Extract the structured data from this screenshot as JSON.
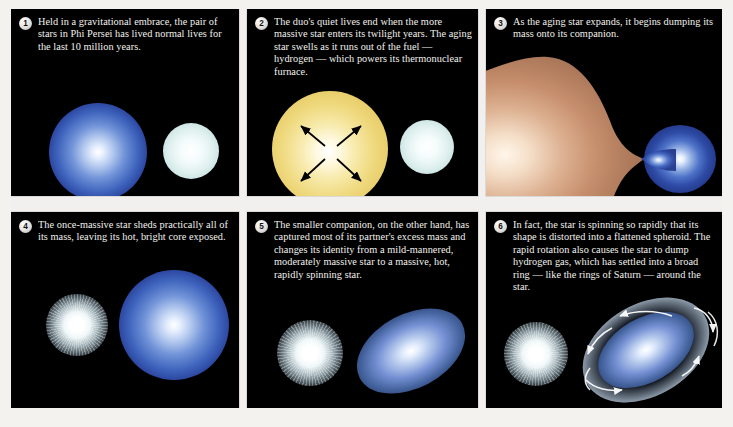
{
  "figure": {
    "background_color": "#f2f0ee",
    "panel_background": "#000000",
    "text_color": "#f3f2ee"
  },
  "panels": [
    {
      "number": "1",
      "caption": "Held in a gravitational embrace, the pair of stars in Phi Persei has lived normal lives for the last 10 million years.",
      "objects": [
        {
          "name": "massive-blue-star",
          "color": "#3f64bd"
        },
        {
          "name": "companion-white-star",
          "color": "#dff0ef"
        }
      ]
    },
    {
      "number": "2",
      "caption": "The duo's quiet lives end when the more massive star enters its twilight years. The aging star swells as it runs out of the fuel — hydrogen — which powers its thermonuclear furnace.",
      "objects": [
        {
          "name": "swelling-yellow-star",
          "color": "#efd97e"
        },
        {
          "name": "expansion-arrows",
          "color": "#000000"
        },
        {
          "name": "companion-white-star",
          "color": "#dff0ef"
        }
      ]
    },
    {
      "number": "3",
      "caption": "As the aging star expands, it begins dumping its mass onto its companion.",
      "objects": [
        {
          "name": "roche-lobe-overflow-star",
          "color": "#c08a6a"
        },
        {
          "name": "accreting-blue-companion",
          "color": "#3f64bd"
        }
      ]
    },
    {
      "number": "4",
      "caption": "The once-massive star sheds practically all of its mass, leaving its hot, bright core exposed.",
      "objects": [
        {
          "name": "exposed-hot-core",
          "color": "#eef6f8"
        },
        {
          "name": "grown-blue-star",
          "color": "#3f64bd"
        }
      ]
    },
    {
      "number": "5",
      "caption": "The smaller companion, on the other hand, has captured most of its partner's excess mass and changes its identity from a mild-mannered, moderately massive star to a massive, hot, rapidly spinning star.",
      "objects": [
        {
          "name": "exposed-hot-core",
          "color": "#eef6f8"
        },
        {
          "name": "flattened-spinning-star",
          "color": "#45649f"
        }
      ]
    },
    {
      "number": "6",
      "caption": "In fact, the star is spinning so rapidly that its shape is distorted into a flattened spheroid. The rapid rotation also causes the star to dump hydrogen gas,  which has settled into a broad ring — like the rings of Saturn — around the star.",
      "objects": [
        {
          "name": "exposed-hot-core",
          "color": "#eef6f8"
        },
        {
          "name": "flattened-spinning-star",
          "color": "#45649f"
        },
        {
          "name": "hydrogen-gas-ring",
          "color": "#cde0f5"
        },
        {
          "name": "rotation-arrows",
          "color": "#ffffff"
        }
      ]
    }
  ]
}
